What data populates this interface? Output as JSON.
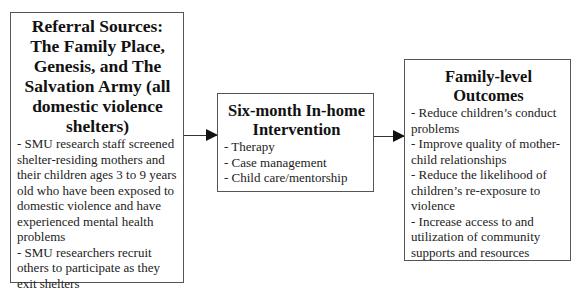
{
  "boxes": {
    "referral": {
      "title": "Referral Sources: The Family Place, Genesis, and The Salvation Army (all domestic violence shelters)",
      "items": [
        "- SMU research staff screened shelter-residing mothers and their children ages 3 to 9 years old who have been exposed to domestic violence and have experienced mental health problems",
        "- SMU researchers recruit others to participate as they exit shelters"
      ]
    },
    "intervention": {
      "title": "Six-month In-home Intervention",
      "items": [
        "- Therapy",
        "- Case management",
        "- Child care/mentorship"
      ]
    },
    "outcomes": {
      "title": "Family-level Outcomes",
      "items": [
        "- Reduce children’s conduct problems",
        "- Improve quality of mother-child relationships",
        "- Reduce the likelihood of children’s re-exposure to violence",
        "- Increase access to and utilization of community supports and resources"
      ]
    }
  },
  "arrows": [
    {
      "from": "referral",
      "to": "intervention"
    },
    {
      "from": "intervention",
      "to": "outcomes"
    }
  ]
}
